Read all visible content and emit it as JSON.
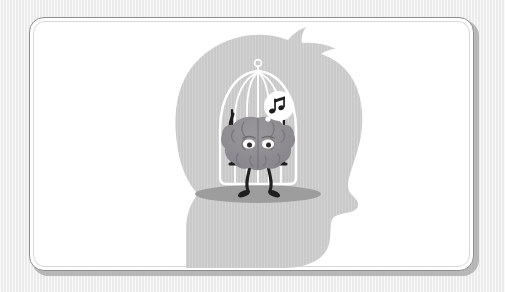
{
  "scene": {
    "title": "Brain in a birdcage inside a human head silhouette",
    "background_color": "#f3f3f3",
    "card_background_color": "#ffffff",
    "frame_border_color": "#8e8e8e"
  },
  "figure": {
    "name": "human-head-silhouette",
    "orientation": "profile facing right",
    "fill_color": "#c9c9c9",
    "parts": [
      "hair-swept-up",
      "forehead",
      "nose",
      "lips",
      "chin",
      "neck",
      "shoulders"
    ]
  },
  "cage": {
    "name": "birdcage",
    "stroke_color": "#ffffff",
    "bar_count": 5,
    "has_top_ring": true,
    "has_base_bar": true,
    "shadow_color": "#9a9a9a"
  },
  "character": {
    "name": "brain-character",
    "body_color": "#8f8d90",
    "body_shadow_color": "#7a7880",
    "eye_white_color": "#ffffff",
    "pupil_color": "#2a2a2a",
    "limb_color": "#1f1f1f",
    "pose": "sitting on a swing, legs dangling",
    "arm_count": 2,
    "leg_count": 2
  },
  "swing": {
    "name": "swing",
    "rope_color": "#1f1f1f",
    "seat_color": "#1f1f1f"
  },
  "speech_bubble": {
    "name": "music-note-bubble",
    "shape": "circle",
    "fill_color": "#ffffff",
    "icon": "music-note-icon",
    "glyph": "♫",
    "glyph_color": "#1f1f1f"
  },
  "labels": {
    "alt_text": "A grey silhouette of a human head in profile with a white birdcage inside; a cartoon brain sits on a swing inside the cage singing a musical note."
  }
}
